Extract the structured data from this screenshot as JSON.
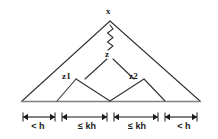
{
  "figure": {
    "stroke_color": "#333333",
    "baseline_color": "#777777",
    "background_color": "#ffffff"
  },
  "nodes": [
    {
      "id": "x",
      "label": "x",
      "role": "root-apex"
    },
    {
      "id": "z",
      "label": "z",
      "role": "internal-node"
    },
    {
      "id": "z1",
      "label": "z1",
      "role": "left-child"
    },
    {
      "id": "z2",
      "label": "z2",
      "role": "right-child"
    }
  ],
  "edges": [
    {
      "from": "x",
      "to": "z",
      "style": "zigzag",
      "meaning": "path"
    },
    {
      "from": "z",
      "to": "z1",
      "style": "straight"
    },
    {
      "from": "z",
      "to": "z2",
      "style": "straight"
    }
  ],
  "spans": [
    {
      "index": 0,
      "label": "< h",
      "relation": "lt",
      "value": "h"
    },
    {
      "index": 1,
      "label": "≤ kh",
      "relation": "le",
      "value": "kh"
    },
    {
      "index": 2,
      "label": "≤ kh",
      "relation": "le",
      "value": "kh"
    },
    {
      "index": 3,
      "label": "< h",
      "relation": "lt",
      "value": "h"
    }
  ]
}
